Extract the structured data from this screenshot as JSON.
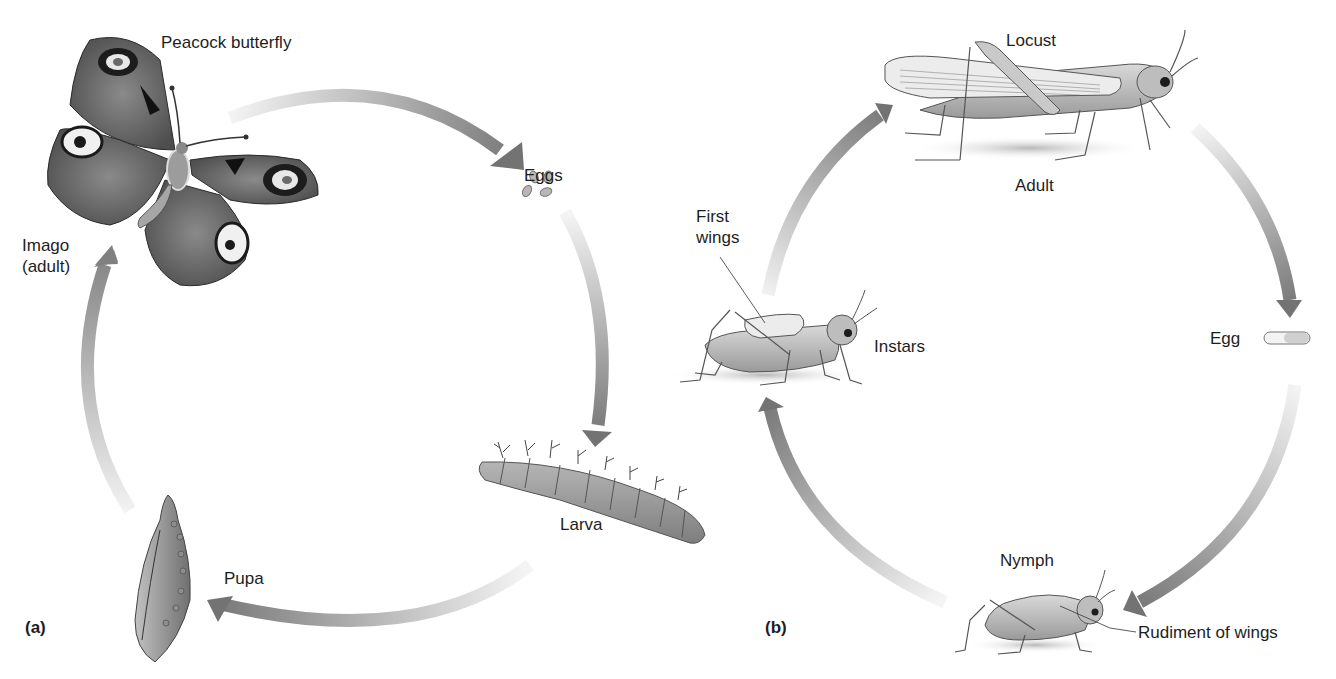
{
  "diagram": {
    "panel_a": {
      "panel_label": "(a)",
      "organism": "Peacock butterfly",
      "stages": {
        "imago": "Imago\n(adult)",
        "imago_line1": "Imago",
        "imago_line2": "(adult)",
        "eggs": "Eggs",
        "larva": "Larva",
        "pupa": "Pupa"
      },
      "cycle_order": [
        "Imago (adult)",
        "Eggs",
        "Larva",
        "Pupa"
      ]
    },
    "panel_b": {
      "panel_label": "(b)",
      "organism": "Locust",
      "stages": {
        "adult": "Adult",
        "egg": "Egg",
        "nymph": "Nymph",
        "instars": "Instars"
      },
      "callouts": {
        "first_wings_line1": "First",
        "first_wings_line2": "wings",
        "rudiment_of_wings": "Rudiment of wings"
      },
      "cycle_order": [
        "Adult",
        "Egg",
        "Nymph",
        "Instars"
      ]
    },
    "colors": {
      "arrow_dark": "#7a7a7a",
      "arrow_light": "#f2f2f2",
      "text": "#1e1e1e",
      "background": "#ffffff"
    }
  }
}
